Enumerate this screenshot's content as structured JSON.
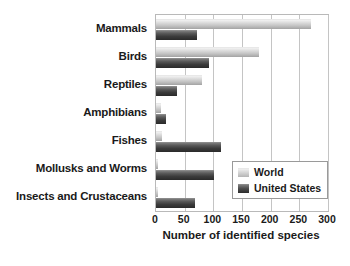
{
  "chart_data": {
    "type": "bar",
    "orientation": "horizontal",
    "title": "",
    "xlabel": "Number of identified species",
    "ylabel": "",
    "xlim": [
      0,
      300
    ],
    "xticks": [
      0,
      50,
      100,
      150,
      200,
      250,
      300
    ],
    "grid": "vertical",
    "legend_position": "lower-right",
    "categories": [
      "Mammals",
      "Birds",
      "Reptiles",
      "Amphibians",
      "Fishes",
      "Mollusks and Worms",
      "Insects and Crustaceans"
    ],
    "series": [
      {
        "name": "World",
        "color": "#d8d8d8",
        "values": [
          270,
          180,
          80,
          8,
          11,
          3,
          3
        ]
      },
      {
        "name": "United States",
        "color": "#3b3b3b",
        "values": [
          72,
          93,
          36,
          17,
          114,
          102,
          68
        ]
      }
    ]
  },
  "legend": {
    "entries": [
      {
        "label": "World"
      },
      {
        "label": "United States"
      }
    ]
  }
}
